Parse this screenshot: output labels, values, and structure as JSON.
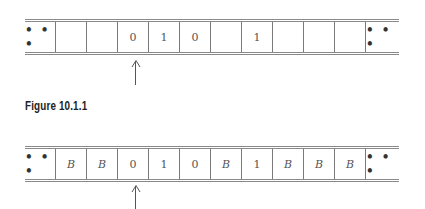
{
  "figure1": {
    "tape_cells": [
      "• • •",
      "",
      "",
      "0",
      "1",
      "0",
      "",
      "1",
      "",
      "",
      "",
      "• • •"
    ],
    "head_position_index": 3
  },
  "caption": "Figure 10.1.1",
  "figure2": {
    "tape_cells": [
      "• • •",
      "B",
      "B",
      "0",
      "1",
      "0",
      "B",
      "1",
      "B",
      "B",
      "B",
      "• • •"
    ],
    "head_position_index": 3
  }
}
